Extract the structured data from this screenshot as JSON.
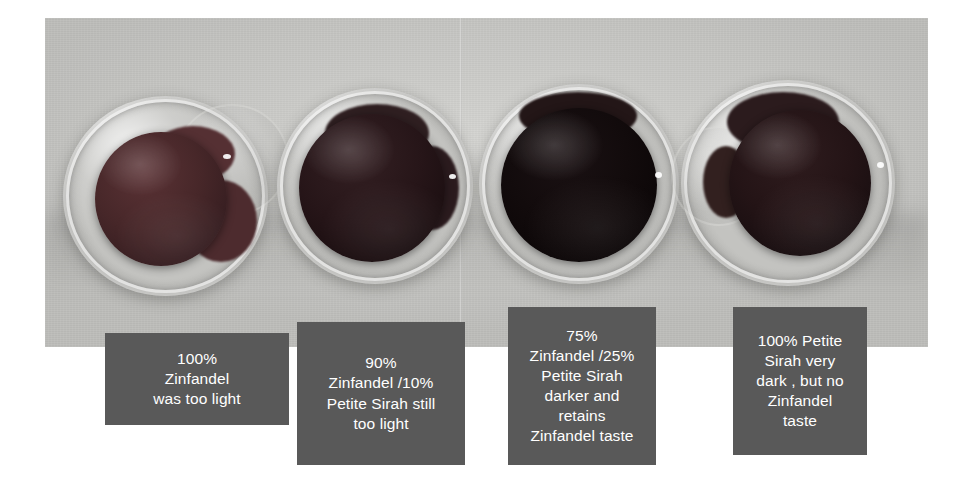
{
  "photo": {
    "alt_name": "four-wine-glasses-top-down-comparison",
    "backdrop_color": "#c6c6c3",
    "glasses": [
      {
        "name": "glass-1",
        "wine_color": "#4a2a2c",
        "label": "100% Zinfandel",
        "darkness": "lightest"
      },
      {
        "name": "glass-2",
        "wine_color": "#2b1a1d",
        "label": "90% Zinfandel / 10% Petite Sirah",
        "darkness": "light"
      },
      {
        "name": "glass-3",
        "wine_color": "#140c0e",
        "label": "75% Zinfandel / 25% Petite Sirah",
        "darkness": "darkest"
      },
      {
        "name": "glass-4",
        "wine_color": "#271517",
        "label": "100% Petite Sirah",
        "darkness": "very dark"
      }
    ]
  },
  "captions": [
    {
      "id": "caption-1",
      "text": "100%\nZinfandel\nwas too light",
      "bg": "#595959",
      "fg": "#ffffff"
    },
    {
      "id": "caption-2",
      "text": "90%\nZinfandel /10%\nPetite Sirah still\ntoo light",
      "bg": "#595959",
      "fg": "#ffffff"
    },
    {
      "id": "caption-3",
      "text": "75%\nZinfandel /25%\nPetite Sirah\ndarker and\nretains\nZinfandel taste",
      "bg": "#595959",
      "fg": "#ffffff"
    },
    {
      "id": "caption-4",
      "text": "100% Petite\nSirah very\ndark , but no\nZinfandel\ntaste",
      "bg": "#595959",
      "fg": "#ffffff"
    }
  ]
}
